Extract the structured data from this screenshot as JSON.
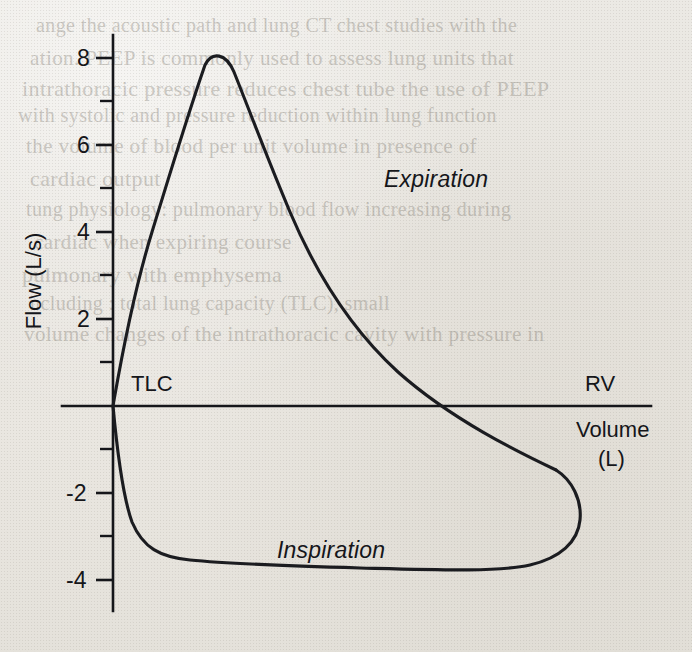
{
  "figure": {
    "kind": "flow-volume-loop",
    "ylabel": "Flow (L/s)",
    "xlabel_line1": "Volume",
    "xlabel_line2": "(L)",
    "annotations": {
      "expiration": "Expiration",
      "inspiration": "Inspiration",
      "tlc": "TLC",
      "rv": "RV"
    },
    "colors": {
      "ink": "#15161a",
      "curve": "#1b1c20",
      "paper": "#e9e7e2"
    }
  },
  "chart_data": {
    "type": "line",
    "title": "",
    "xlabel": "Volume (L)",
    "ylabel": "Flow (L/s)",
    "grid": false,
    "legend": "none",
    "ylim": [
      -5,
      8.8
    ],
    "xlim": [
      0,
      6.2
    ],
    "y_ticks_major": [
      8,
      6,
      4,
      2,
      -2,
      -4
    ],
    "y_tick_labels": [
      "8",
      "6",
      "4",
      "2",
      "-2",
      "-4"
    ],
    "y_ticks_minor": [
      7,
      5,
      3,
      1,
      -1,
      -3,
      -5
    ],
    "x_ticks": [],
    "x_tick_labels": [],
    "markers": [
      {
        "label": "TLC",
        "x": 0.0,
        "y": 0.0
      },
      {
        "label": "RV",
        "x": 5.3,
        "y": 0.0
      }
    ],
    "series": [
      {
        "name": "Expiration",
        "direction": "TLC to RV",
        "peak_flow": 8.2,
        "peak_volume": 0.95,
        "x": [
          0.0,
          0.2,
          0.45,
          0.7,
          0.95,
          1.2,
          1.5,
          1.9,
          2.4,
          2.9,
          3.4,
          3.9,
          4.35,
          4.75,
          5.05,
          5.22,
          5.3
        ],
        "y": [
          0.0,
          2.6,
          5.6,
          7.55,
          8.2,
          8.05,
          7.55,
          6.85,
          5.95,
          5.05,
          4.2,
          3.35,
          2.5,
          1.6,
          0.8,
          0.3,
          0.0
        ]
      },
      {
        "name": "Inspiration",
        "direction": "RV to TLC",
        "peak_flow": -3.65,
        "x": [
          5.3,
          5.38,
          5.4,
          5.3,
          5.1,
          4.8,
          4.4,
          3.9,
          3.4,
          2.9,
          2.4,
          1.9,
          1.5,
          1.15,
          0.85,
          0.6,
          0.38,
          0.2,
          0.08,
          0.0
        ],
        "y": [
          0.0,
          -0.55,
          -1.3,
          -2.25,
          -2.95,
          -3.35,
          -3.52,
          -3.6,
          -3.62,
          -3.63,
          -3.63,
          -3.6,
          -3.55,
          -3.45,
          -3.2,
          -2.8,
          -2.15,
          -1.35,
          -0.6,
          0.0
        ]
      }
    ]
  },
  "bleedthrough": [
    {
      "text": "ange the acoustic path and lung CT chest studies with the",
      "x": 36,
      "y": 14
    },
    {
      "text": "ation. PEEP is commonly used to assess lung units that",
      "x": 30,
      "y": 46
    },
    {
      "text": "intrathoracic pressure reduces chest tube the use of PEEP",
      "x": 22,
      "y": 76
    },
    {
      "text": "with systolic and pressure reduction within lung function",
      "x": 18,
      "y": 104
    },
    {
      "text": "the volume of blood per unit volume in presence of",
      "x": 26,
      "y": 134
    },
    {
      "text": "cardiac output",
      "x": 30,
      "y": 166
    },
    {
      "text": "tung physiology: pulmonary blood flow increasing during",
      "x": 26,
      "y": 198
    },
    {
      "text": "cardiac when expiring course",
      "x": 34,
      "y": 230
    },
    {
      "text": "pulmonary with emphysema",
      "x": 22,
      "y": 262
    },
    {
      "text": "ncluding : total lung capacity (TLC), small",
      "x": 30,
      "y": 292
    },
    {
      "text": "volume changes of the intrathoracic cavity with pressure in",
      "x": 24,
      "y": 322
    }
  ]
}
